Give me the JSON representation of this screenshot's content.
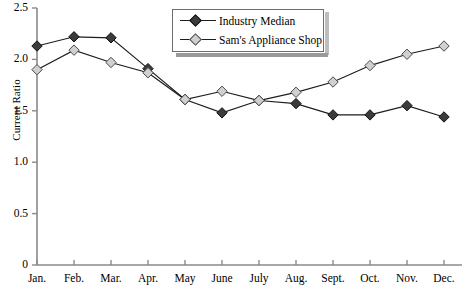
{
  "chart_data": {
    "type": "line",
    "title": "",
    "xlabel": "",
    "ylabel": "Current Ratio",
    "categories": [
      "Jan.",
      "Feb.",
      "Mar.",
      "Apr.",
      "May",
      "June",
      "July",
      "Aug.",
      "Sept.",
      "Oct.",
      "Nov.",
      "Dec."
    ],
    "ylim": [
      0,
      2.5
    ],
    "yticks": [
      "0",
      "0.5",
      "1.0",
      "1.5",
      "2.0",
      "2.5"
    ],
    "ytick_values": [
      0,
      0.5,
      1.0,
      1.5,
      2.0,
      2.5
    ],
    "grid": false,
    "legend_position": "top-center",
    "series": [
      {
        "name": "Industry Median",
        "marker": "filled-diamond",
        "color": "#3b3b3b",
        "values": [
          2.13,
          2.22,
          2.21,
          1.91,
          1.61,
          1.48,
          1.6,
          1.57,
          1.46,
          1.46,
          1.55,
          1.44
        ]
      },
      {
        "name": "Sam's Appliance Shop",
        "marker": "open-diamond",
        "color": "#d0d0d0",
        "values": [
          1.9,
          2.09,
          1.97,
          1.87,
          1.61,
          1.69,
          1.6,
          1.68,
          1.78,
          1.94,
          2.05,
          2.13
        ]
      }
    ]
  },
  "legend": {
    "items": [
      {
        "label": "Industry Median"
      },
      {
        "label": "Sam's Appliance Shop"
      }
    ]
  },
  "axes": {
    "y_axis_title": "Current Ratio"
  }
}
